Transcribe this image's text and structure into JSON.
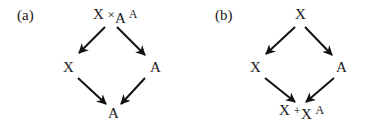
{
  "diagrams": [
    {
      "panel_label": "(a)",
      "top": {
        "left": "X",
        "op": "×",
        "sub": "A",
        "right": "A"
      },
      "left_node": "X",
      "right_node": "A",
      "bottom": {
        "text": "A"
      },
      "edges": [
        {
          "from": "top",
          "to": "left"
        },
        {
          "from": "top",
          "to": "right"
        },
        {
          "from": "left",
          "to": "bottom"
        },
        {
          "from": "right",
          "to": "bottom"
        }
      ]
    },
    {
      "panel_label": "(b)",
      "top": {
        "text": "X"
      },
      "left_node": "X",
      "right_node": "A",
      "bottom": {
        "left": "X",
        "op": "+",
        "sub": "X",
        "right": "A"
      },
      "edges": [
        {
          "from": "top",
          "to": "left"
        },
        {
          "from": "top",
          "to": "right"
        },
        {
          "from": "left",
          "to": "bottom"
        },
        {
          "from": "right",
          "to": "bottom"
        }
      ]
    }
  ]
}
